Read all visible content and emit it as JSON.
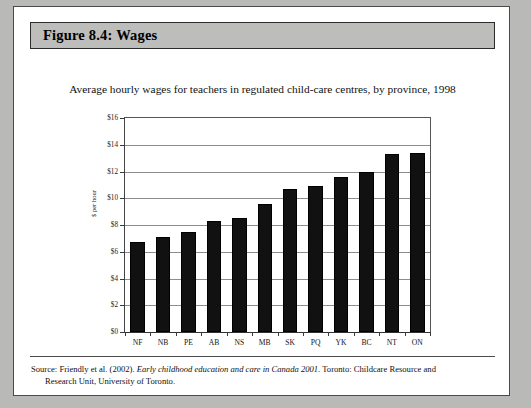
{
  "figure": {
    "header_label": "Figure 8.4:  Wages"
  },
  "chart_data": {
    "type": "bar",
    "title": "Average hourly wages for teachers in regulated child-care centres, by province, 1998",
    "xlabel": "",
    "ylabel": "$ per hour",
    "categories": [
      "NF",
      "NB",
      "PE",
      "AB",
      "NS",
      "MB",
      "SK",
      "PQ",
      "YK",
      "BC",
      "NT",
      "ON"
    ],
    "values": [
      6.7,
      7.1,
      7.5,
      8.3,
      8.5,
      9.6,
      10.7,
      10.9,
      11.6,
      12.0,
      13.3,
      13.4
    ],
    "ylim": [
      0,
      16
    ],
    "ytick_step": 2,
    "ytick_labels": [
      "$0",
      "$2",
      "$4",
      "$6",
      "$8",
      "$10",
      "$12",
      "$14",
      "$16"
    ],
    "grid": true,
    "legend": false,
    "bar_color": "#111111"
  },
  "source": {
    "prefix": "Source: Friendly et al. (2002).",
    "italic_title": "Early childhood education and care in Canada 2001",
    "suffix": ". Toronto: Childcare Resource and",
    "continuation": "Research Unit, University of Toronto."
  }
}
